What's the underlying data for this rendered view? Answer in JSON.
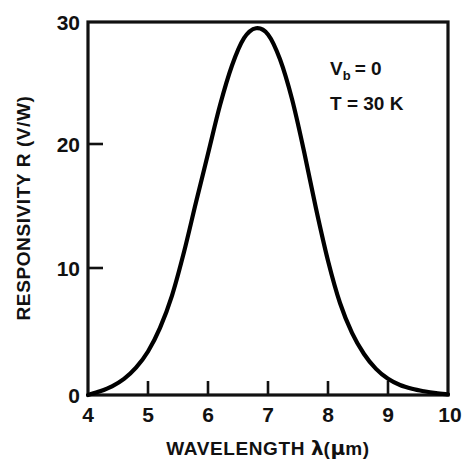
{
  "chart_data": {
    "type": "line",
    "title": "",
    "xlabel": "WAVELENGTH λ(μm)",
    "ylabel": "RESPONSIVITY R (V/W)",
    "xlim": [
      4,
      10
    ],
    "ylim": [
      0,
      30
    ],
    "grid": false,
    "legend": "none",
    "x_ticks": [
      4,
      5,
      6,
      7,
      8,
      9,
      10
    ],
    "x_tick_labels": [
      "4",
      "5",
      "6",
      "7",
      "8",
      "9",
      "10"
    ],
    "y_ticks": [
      0,
      10,
      20,
      30
    ],
    "y_tick_labels": [
      "0",
      "10",
      "20",
      "30"
    ],
    "series": [
      {
        "name": "Responsivity",
        "color": "#000000",
        "x": [
          4.0,
          4.2,
          4.4,
          4.6,
          4.8,
          5.0,
          5.2,
          5.4,
          5.6,
          5.8,
          6.0,
          6.2,
          6.4,
          6.6,
          6.8,
          7.0,
          7.2,
          7.4,
          7.6,
          7.8,
          8.0,
          8.2,
          8.4,
          8.6,
          8.8,
          9.0,
          9.2,
          9.4,
          9.6,
          9.8,
          10.0
        ],
        "y": [
          0.0,
          0.3,
          0.7,
          1.3,
          2.2,
          3.5,
          5.4,
          8.0,
          11.5,
          15.5,
          19.4,
          23.3,
          26.5,
          28.7,
          29.5,
          29.0,
          27.0,
          23.8,
          19.6,
          15.0,
          10.8,
          7.4,
          5.0,
          3.3,
          2.1,
          1.3,
          0.8,
          0.5,
          0.3,
          0.15,
          0.05
        ]
      }
    ],
    "annotations": [
      {
        "id": "bias",
        "text": "V",
        "sub": "b",
        "tail": " = 0",
        "x": 7.9,
        "y": 26.0
      },
      {
        "id": "temperature",
        "text": "T = 30 K",
        "x": 7.9,
        "y": 23.2
      }
    ]
  },
  "axes": {
    "x_title_prefix": "WAVELENGTH ",
    "x_title_lambda": "λ",
    "x_title_open": "(",
    "x_title_mu": "μ",
    "x_title_unit": "m",
    "x_title_close": ")",
    "y_title": "RESPONSIVITY R (V/W)"
  },
  "annotations": {
    "bias_symbol": "V",
    "bias_subscript": "b",
    "bias_value": "= 0",
    "temperature_line": "T = 30 K"
  },
  "colors": {
    "curve": "#000000",
    "frame": "#111111",
    "background": "#ffffff"
  }
}
